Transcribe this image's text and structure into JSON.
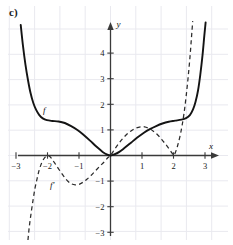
{
  "figure": {
    "part_label": "c)",
    "axis": {
      "x_name": "x",
      "y_name": "y"
    },
    "curve_labels": {
      "f": "f",
      "f_prime": "f'"
    },
    "x_ticks": [
      "-3",
      "-2",
      "-1",
      "1",
      "2",
      "3"
    ],
    "y_ticks": [
      "4",
      "3",
      "2",
      "1",
      "-1",
      "-2",
      "-3"
    ],
    "colors": {
      "curve_f": "#141414",
      "curve_f_prime": "#2b2b2b",
      "axis": "#3a3a3a",
      "grid": "#e9e9ef",
      "background": "#ffffff"
    }
  },
  "chart_data": {
    "type": "line",
    "title": "c)",
    "xlabel": "x",
    "ylabel": "y",
    "xlim": [
      -3.35,
      3.45
    ],
    "ylim": [
      -3.35,
      5.3
    ],
    "xticks": [
      -3,
      -2,
      -1,
      1,
      2,
      3
    ],
    "yticks": [
      4,
      3,
      2,
      1,
      -1,
      -2,
      -3
    ],
    "grid": true,
    "legend": "inline-labels",
    "series": [
      {
        "name": "f",
        "style": "solid",
        "label_position": {
          "x": -2.1,
          "y": 1.65
        },
        "points": [
          {
            "x": -2.85,
            "y": 5.1
          },
          {
            "x": -2.78,
            "y": 4.3
          },
          {
            "x": -2.7,
            "y": 3.55
          },
          {
            "x": -2.62,
            "y": 2.95
          },
          {
            "x": -2.54,
            "y": 2.45
          },
          {
            "x": -2.45,
            "y": 2.05
          },
          {
            "x": -2.36,
            "y": 1.78
          },
          {
            "x": -2.26,
            "y": 1.58
          },
          {
            "x": -2.15,
            "y": 1.45
          },
          {
            "x": -2.02,
            "y": 1.38
          },
          {
            "x": -1.85,
            "y": 1.35
          },
          {
            "x": -1.65,
            "y": 1.33
          },
          {
            "x": -1.45,
            "y": 1.27
          },
          {
            "x": -1.25,
            "y": 1.15
          },
          {
            "x": -1.05,
            "y": 1.0
          },
          {
            "x": -0.85,
            "y": 0.8
          },
          {
            "x": -0.65,
            "y": 0.58
          },
          {
            "x": -0.45,
            "y": 0.35
          },
          {
            "x": -0.25,
            "y": 0.14
          },
          {
            "x": -0.1,
            "y": 0.03
          },
          {
            "x": 0.0,
            "y": 0.0
          },
          {
            "x": 0.12,
            "y": 0.04
          },
          {
            "x": 0.28,
            "y": 0.14
          },
          {
            "x": 0.45,
            "y": 0.3
          },
          {
            "x": 0.65,
            "y": 0.5
          },
          {
            "x": 0.85,
            "y": 0.7
          },
          {
            "x": 1.05,
            "y": 0.88
          },
          {
            "x": 1.25,
            "y": 1.03
          },
          {
            "x": 1.45,
            "y": 1.15
          },
          {
            "x": 1.65,
            "y": 1.25
          },
          {
            "x": 1.85,
            "y": 1.32
          },
          {
            "x": 2.05,
            "y": 1.36
          },
          {
            "x": 2.25,
            "y": 1.4
          },
          {
            "x": 2.4,
            "y": 1.46
          },
          {
            "x": 2.52,
            "y": 1.58
          },
          {
            "x": 2.62,
            "y": 1.8
          },
          {
            "x": 2.7,
            "y": 2.1
          },
          {
            "x": 2.78,
            "y": 2.55
          },
          {
            "x": 2.85,
            "y": 3.15
          },
          {
            "x": 2.92,
            "y": 3.9
          },
          {
            "x": 2.98,
            "y": 4.7
          },
          {
            "x": 3.02,
            "y": 5.2
          }
        ]
      },
      {
        "name": "f'",
        "style": "dashed",
        "label_position": {
          "x": -1.85,
          "y": -1.25
        },
        "points": [
          {
            "x": -2.62,
            "y": -3.3
          },
          {
            "x": -2.58,
            "y": -2.8
          },
          {
            "x": -2.52,
            "y": -2.25
          },
          {
            "x": -2.46,
            "y": -1.75
          },
          {
            "x": -2.4,
            "y": -1.3
          },
          {
            "x": -2.33,
            "y": -0.9
          },
          {
            "x": -2.26,
            "y": -0.55
          },
          {
            "x": -2.18,
            "y": -0.28
          },
          {
            "x": -2.1,
            "y": -0.1
          },
          {
            "x": -2.02,
            "y": -0.02
          },
          {
            "x": -1.95,
            "y": -0.02
          },
          {
            "x": -1.88,
            "y": -0.1
          },
          {
            "x": -1.78,
            "y": -0.28
          },
          {
            "x": -1.66,
            "y": -0.5
          },
          {
            "x": -1.52,
            "y": -0.75
          },
          {
            "x": -1.38,
            "y": -0.97
          },
          {
            "x": -1.25,
            "y": -1.1
          },
          {
            "x": -1.12,
            "y": -1.15
          },
          {
            "x": -1.0,
            "y": -1.13
          },
          {
            "x": -0.88,
            "y": -1.05
          },
          {
            "x": -0.75,
            "y": -0.93
          },
          {
            "x": -0.62,
            "y": -0.78
          },
          {
            "x": -0.48,
            "y": -0.6
          },
          {
            "x": -0.34,
            "y": -0.42
          },
          {
            "x": -0.2,
            "y": -0.25
          },
          {
            "x": -0.08,
            "y": -0.08
          },
          {
            "x": 0.0,
            "y": 0.0
          },
          {
            "x": 0.12,
            "y": 0.22
          },
          {
            "x": 0.25,
            "y": 0.45
          },
          {
            "x": 0.38,
            "y": 0.65
          },
          {
            "x": 0.52,
            "y": 0.83
          },
          {
            "x": 0.66,
            "y": 0.97
          },
          {
            "x": 0.8,
            "y": 1.07
          },
          {
            "x": 0.95,
            "y": 1.12
          },
          {
            "x": 1.08,
            "y": 1.12
          },
          {
            "x": 1.22,
            "y": 1.06
          },
          {
            "x": 1.36,
            "y": 0.95
          },
          {
            "x": 1.5,
            "y": 0.8
          },
          {
            "x": 1.63,
            "y": 0.62
          },
          {
            "x": 1.75,
            "y": 0.44
          },
          {
            "x": 1.86,
            "y": 0.26
          },
          {
            "x": 1.95,
            "y": 0.1
          },
          {
            "x": 2.0,
            "y": 0.0
          },
          {
            "x": 2.06,
            "y": 0.12
          },
          {
            "x": 2.13,
            "y": 0.38
          },
          {
            "x": 2.2,
            "y": 0.72
          },
          {
            "x": 2.27,
            "y": 1.15
          },
          {
            "x": 2.34,
            "y": 1.7
          },
          {
            "x": 2.4,
            "y": 2.3
          },
          {
            "x": 2.46,
            "y": 3.0
          },
          {
            "x": 2.52,
            "y": 3.8
          },
          {
            "x": 2.57,
            "y": 4.6
          },
          {
            "x": 2.61,
            "y": 5.25
          }
        ]
      }
    ]
  }
}
